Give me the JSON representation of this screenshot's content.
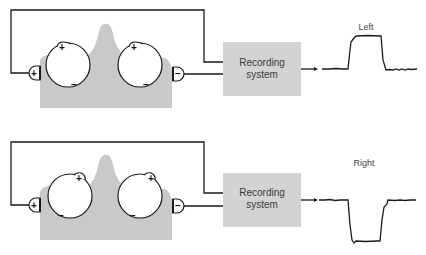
{
  "panels": [
    {
      "id": "top",
      "gaze": "left",
      "trace_label": "Left",
      "recording_box": {
        "line1": "Recording",
        "line2": "system"
      },
      "left_electrode_sign": "+",
      "right_electrode_sign": "−",
      "left_eye": {
        "cornea_sign": "+",
        "retina_sign": "−"
      },
      "right_eye": {
        "cornea_sign": "+",
        "retina_sign": "−"
      },
      "trace_direction": "up"
    },
    {
      "id": "bottom",
      "gaze": "right",
      "trace_label": "Right",
      "recording_box": {
        "line1": "Recording",
        "line2": "system"
      },
      "left_electrode_sign": "+",
      "right_electrode_sign": "−",
      "left_eye": {
        "cornea_sign": "+",
        "retina_sign": "−"
      },
      "right_eye": {
        "cornea_sign": "+",
        "retina_sign": "−"
      },
      "trace_direction": "down"
    }
  ],
  "colors": {
    "head_fill": "#c8c8c8",
    "box_fill": "#d4d4d4",
    "line": "#1a1a1a"
  }
}
